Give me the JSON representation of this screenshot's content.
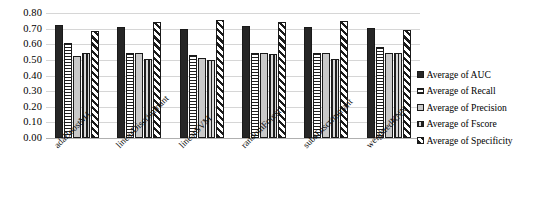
{
  "chart_data": {
    "type": "bar",
    "title": "",
    "xlabel": "",
    "ylabel": "",
    "ylim": [
      0.0,
      0.8
    ],
    "ytick_labels": [
      "0.80",
      "0.70",
      "0.60",
      "0.50",
      "0.40",
      "0.30",
      "0.20",
      "0.10",
      "0.00"
    ],
    "ytick_values": [
      0.8,
      0.7,
      0.6,
      0.5,
      0.4,
      0.3,
      0.2,
      0.1,
      0.0
    ],
    "grid": true,
    "legend_position": "right",
    "categories": [
      "adaBoostM1",
      "linearDiscriminant",
      "linearSVM",
      "randomForest",
      "subsDiscriminant",
      "weightedKNN"
    ],
    "series": [
      {
        "name": "Average of AUC",
        "pattern": "dark-dotted",
        "values": [
          0.725,
          0.71,
          0.695,
          0.715,
          0.71,
          0.705
        ]
      },
      {
        "name": "Average of Recall",
        "pattern": "horizontal-stripes",
        "values": [
          0.61,
          0.545,
          0.53,
          0.545,
          0.545,
          0.58
        ]
      },
      {
        "name": "Average of Precision",
        "pattern": "light-gray-dotted",
        "values": [
          0.528,
          0.545,
          0.515,
          0.545,
          0.545,
          0.545
        ]
      },
      {
        "name": "Average of Fscore",
        "pattern": "vertical-lines",
        "values": [
          0.545,
          0.505,
          0.5,
          0.54,
          0.505,
          0.545
        ]
      },
      {
        "name": "Average of Specificity",
        "pattern": "diagonal-stripes",
        "values": [
          0.688,
          0.745,
          0.755,
          0.745,
          0.75,
          0.69
        ]
      }
    ]
  },
  "legend": {
    "items": [
      {
        "label": "Average of AUC"
      },
      {
        "label": "Average of Recall"
      },
      {
        "label": "Average of Precision"
      },
      {
        "label": "Average of Fscore"
      },
      {
        "label": "Average of Specificity"
      }
    ]
  },
  "colors": {
    "series_dark": "#262626",
    "series_light_gray": "#c9c9c9",
    "gridline": "#d6d6d6",
    "axis": "#b0b0b0",
    "text": "#000000",
    "background": "#ffffff"
  }
}
